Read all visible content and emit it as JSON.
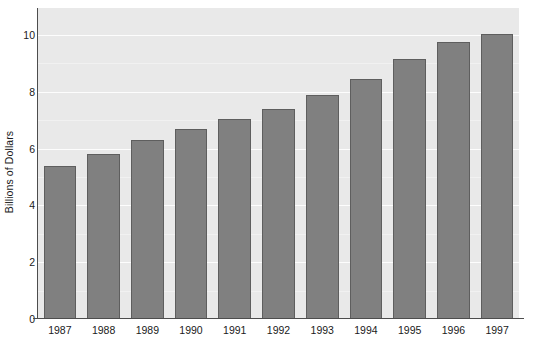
{
  "chart_data": {
    "type": "bar",
    "title": "",
    "xlabel": "",
    "ylabel": "Billions of Dollars",
    "categories": [
      "1987",
      "1988",
      "1989",
      "1990",
      "1991",
      "1992",
      "1993",
      "1994",
      "1995",
      "1996",
      "1997"
    ],
    "values": [
      5.4,
      5.8,
      6.3,
      6.7,
      7.05,
      7.4,
      7.9,
      8.45,
      9.15,
      9.75,
      10.05
    ],
    "series": [
      {
        "name": "Billions of Dollars",
        "values": [
          5.4,
          5.8,
          6.3,
          6.7,
          7.05,
          7.4,
          7.9,
          8.45,
          9.15,
          9.75,
          10.05
        ]
      }
    ],
    "ylim": [
      0,
      10.95
    ],
    "y_ticks": [
      0,
      2,
      4,
      6,
      8,
      10
    ],
    "y_tick_labels": [
      "0",
      "2",
      "4",
      "6",
      "8",
      "10"
    ],
    "y_minor_ticks": [
      1,
      3,
      5,
      7,
      9
    ],
    "grid": true,
    "grid_axis": "y",
    "legend": "none",
    "colors": {
      "bar_fill": "#808080",
      "bar_border": "#5e5e5e",
      "plot_background": "#e9e9e9",
      "gridline_major": "#fdfdfd",
      "gridline_minor": "#f1f1f1",
      "axis_line": "#4d4d4d",
      "text": "#1a1a1a",
      "figure_background": "#ffffff"
    }
  }
}
